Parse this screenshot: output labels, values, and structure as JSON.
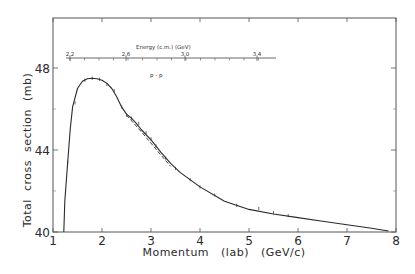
{
  "chart_data": {
    "type": "line",
    "title": "",
    "annotation": "p-p",
    "xlabel": "Momentum   (lab)   (GeV/c)",
    "ylabel": "Total  cross  section  (mb)",
    "xlim": [
      1,
      8
    ],
    "ylim": [
      40,
      50.4
    ],
    "x_ticks": [
      1,
      2,
      3,
      4,
      5,
      6,
      7,
      8
    ],
    "y_ticks": [
      40,
      44,
      48
    ],
    "y_minor_ticks": [
      42,
      46
    ],
    "grid": false,
    "secondary_axis": {
      "label": "Energy (c.m.)   (GeV)",
      "tick_labels": [
        "2.2",
        "2.6",
        "3.0",
        "3.4"
      ],
      "position": "top-inner"
    },
    "series": [
      {
        "name": "smooth fit",
        "style": "solid",
        "x": [
          1.22,
          1.24,
          1.3,
          1.35,
          1.4,
          1.5,
          1.6,
          1.7,
          1.8,
          1.9,
          2.0,
          2.1,
          2.2,
          2.3,
          2.4,
          2.5,
          2.6,
          2.7,
          2.8,
          3.0,
          3.2,
          3.4,
          3.6,
          4.0,
          4.5,
          5.0,
          5.5,
          6.0,
          6.5,
          7.0,
          7.5,
          7.85
        ],
        "values": [
          40.0,
          41.5,
          43.4,
          45.0,
          46.1,
          47.0,
          47.35,
          47.48,
          47.5,
          47.48,
          47.4,
          47.25,
          47.0,
          46.6,
          46.1,
          45.75,
          45.55,
          45.3,
          45.0,
          44.5,
          43.9,
          43.35,
          42.9,
          42.2,
          41.5,
          41.1,
          40.88,
          40.7,
          40.52,
          40.35,
          40.18,
          40.05
        ]
      },
      {
        "name": "alternative fit",
        "style": "dashed",
        "x": [
          2.5,
          2.8,
          3.1,
          3.4
        ],
        "values": [
          45.7,
          44.9,
          44.05,
          43.2
        ]
      },
      {
        "name": "data points",
        "style": "markers",
        "x": [
          1.3,
          1.45,
          1.65,
          1.8,
          1.95,
          2.1,
          2.25,
          2.4,
          2.5,
          2.6,
          2.75,
          2.9,
          3.0,
          3.1,
          3.3,
          3.5,
          3.8,
          4.0,
          4.3,
          4.75,
          5.2,
          5.5,
          5.8
        ],
        "values": [
          43.4,
          46.3,
          47.4,
          47.5,
          47.45,
          47.2,
          46.9,
          46.1,
          45.7,
          45.55,
          45.3,
          44.85,
          44.55,
          44.2,
          43.6,
          43.1,
          42.55,
          42.2,
          41.8,
          41.3,
          41.15,
          40.95,
          40.8
        ]
      }
    ]
  },
  "labels": {
    "xlabel": "Momentum   (lab)   (GeV/c)",
    "ylabel": "Total  cross  section  (mb)",
    "annotation": "p - p",
    "energy_axis_title": "Energy (c.m.)    (GeV)",
    "x_ticks": [
      "1",
      "2",
      "3",
      "4",
      "5",
      "6",
      "7",
      "8"
    ],
    "y_ticks": [
      "40",
      "44",
      "48"
    ],
    "energy_ticks": [
      "2.2",
      "2.6",
      "3.0",
      "3.4"
    ]
  }
}
